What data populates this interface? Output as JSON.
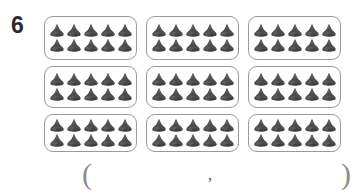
{
  "page": {
    "background_color": "#ffffff",
    "width": 363,
    "height": 196
  },
  "problem": {
    "number": "6",
    "number_color": "#2b2b2b",
    "type": "multiplication-array-of-groups",
    "group_count": 9,
    "items_per_group": 10,
    "total_items": 90,
    "grid": {
      "rows": 3,
      "columns": 3
    },
    "group": {
      "item_rows": 2,
      "items_per_row": 5,
      "item_icon_name": "chocolate-kiss-icon",
      "item_color": "#4d4d4d",
      "box_border_color": "#9a9a9a"
    }
  },
  "answer": {
    "open_paren": "(",
    "comma": ",",
    "close_paren": ")",
    "ink_color": "#8d8d8d"
  },
  "boxes": [
    {
      "id": "box-1",
      "label": "group-1",
      "items": 10
    },
    {
      "id": "box-2",
      "label": "group-2",
      "items": 10
    },
    {
      "id": "box-3",
      "label": "group-3",
      "items": 10
    },
    {
      "id": "box-4",
      "label": "group-4",
      "items": 10
    },
    {
      "id": "box-5",
      "label": "group-5",
      "items": 10
    },
    {
      "id": "box-6",
      "label": "group-6",
      "items": 10
    },
    {
      "id": "box-7",
      "label": "group-7",
      "items": 10
    },
    {
      "id": "box-8",
      "label": "group-8",
      "items": 10
    },
    {
      "id": "box-9",
      "label": "group-9",
      "items": 10
    }
  ]
}
